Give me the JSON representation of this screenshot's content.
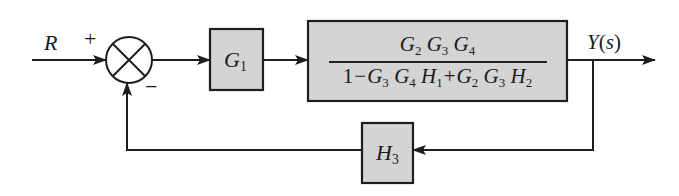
{
  "diagram": {
    "type": "block-diagram",
    "colors": {
      "block_fill": "#d4d4d4",
      "line": "#1e1e1e",
      "background": "#ffffff"
    },
    "input": {
      "label": "R"
    },
    "summing_junction": {
      "plus_sign": "+",
      "minus_sign": "−",
      "symbol": "⊗"
    },
    "block_g1": {
      "name": "G",
      "sub": "1"
    },
    "block_main": {
      "numerator": [
        {
          "name": "G",
          "sub": "2"
        },
        {
          "name": "G",
          "sub": "3"
        },
        {
          "name": "G",
          "sub": "4"
        }
      ],
      "denominator": {
        "one": "1",
        "minus": "−",
        "term1": [
          {
            "name": "G",
            "sub": "3"
          },
          {
            "name": "G",
            "sub": "4"
          },
          {
            "name": "H",
            "sub": "1"
          }
        ],
        "plus": "+",
        "term2": [
          {
            "name": "G",
            "sub": "2"
          },
          {
            "name": "G",
            "sub": "3"
          },
          {
            "name": "H",
            "sub": "2"
          }
        ]
      }
    },
    "output": {
      "label": "Y(s)",
      "label_Y": "Y",
      "label_paren_open": "(",
      "label_s": "s",
      "label_paren_close": ")"
    },
    "feedback_block": {
      "name": "H",
      "sub": "3"
    }
  }
}
